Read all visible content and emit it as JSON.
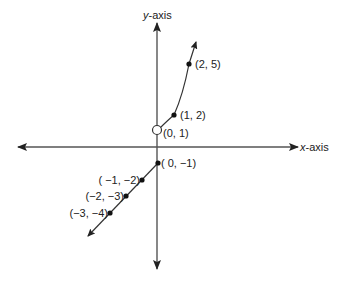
{
  "diagram": {
    "type": "piecewise-function-graph",
    "axes": {
      "x_label_italic": "x",
      "x_label_rest": "-axis",
      "y_label_italic": "y",
      "y_label_rest": "-axis"
    },
    "upper_branch": {
      "open_point": {
        "label": "(0, 1)",
        "x": 0,
        "y": 1,
        "open": true
      },
      "points": [
        {
          "label": "(1, 2)",
          "x": 1,
          "y": 2
        },
        {
          "label": "(2, 5)",
          "x": 2,
          "y": 5
        }
      ]
    },
    "lower_branch": {
      "points": [
        {
          "label": "( 0, −1)",
          "x": 0,
          "y": -1
        },
        {
          "label": "( −1, −2)",
          "x": -1,
          "y": -2
        },
        {
          "label": "(−2, −3)",
          "x": -2,
          "y": -3
        },
        {
          "label": "(−3, −4)",
          "x": -3,
          "y": -4
        }
      ]
    },
    "colors": {
      "line": "#333333",
      "background": "#ffffff"
    }
  }
}
